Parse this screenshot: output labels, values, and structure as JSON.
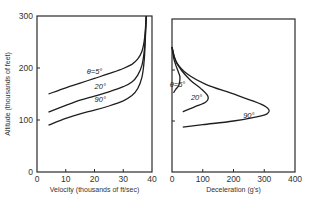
{
  "chart_data": [
    {
      "type": "line",
      "title": "",
      "xlabel": "Velocity (thousands of ft/sec)",
      "ylabel": "Altitude (thousands of feet)",
      "xlim": [
        0,
        40
      ],
      "ylim": [
        0,
        300
      ],
      "xticks": [
        0,
        10,
        20,
        30,
        40
      ],
      "yticks": [
        0,
        100,
        200,
        300
      ],
      "grid": false,
      "series": [
        {
          "name": "θ=5°",
          "label": "θ=5°",
          "x": [
            4,
            10,
            15,
            20,
            25,
            30,
            33,
            35,
            36.5,
            37.3,
            37.7,
            38
          ],
          "y": [
            150,
            162,
            171,
            180,
            189,
            199,
            207,
            217,
            232,
            252,
            275,
            300
          ]
        },
        {
          "name": "20°",
          "label": "20°",
          "x": [
            4,
            10,
            15,
            20,
            25,
            30,
            33,
            35,
            36.5,
            37.3,
            37.7,
            38
          ],
          "y": [
            115,
            128,
            138,
            146,
            154,
            164,
            173,
            186,
            205,
            232,
            265,
            300
          ]
        },
        {
          "name": "90°",
          "label": "90°",
          "x": [
            4,
            10,
            15,
            20,
            25,
            30,
            33,
            35,
            36.5,
            37.3,
            37.7,
            38
          ],
          "y": [
            90,
            103,
            112,
            119,
            127,
            137,
            147,
            160,
            182,
            215,
            258,
            300
          ]
        }
      ]
    },
    {
      "type": "line",
      "title": "",
      "xlabel": "Deceleration (g's)",
      "ylabel": "",
      "xlim": [
        0,
        400
      ],
      "ylim": [
        0,
        300
      ],
      "xticks": [
        0,
        100,
        200,
        300,
        400
      ],
      "yticks": [],
      "grid": false,
      "series": [
        {
          "name": "θ=5°",
          "label": "θ=5°",
          "x": [
            0,
            5,
            12,
            20,
            26,
            22,
            12,
            5
          ],
          "y": [
            245,
            225,
            210,
            197,
            185,
            170,
            162,
            155
          ]
        },
        {
          "name": "20°",
          "label": "20°",
          "x": [
            0,
            10,
            30,
            60,
            95,
            117,
            110,
            75,
            35
          ],
          "y": [
            245,
            220,
            200,
            180,
            163,
            148,
            137,
            128,
            118
          ]
        },
        {
          "name": "90°",
          "label": "90°",
          "x": [
            0,
            15,
            50,
            110,
            190,
            260,
            305,
            315,
            290,
            200,
            100,
            35
          ],
          "y": [
            245,
            215,
            192,
            172,
            155,
            140,
            128,
            118,
            110,
            100,
            93,
            88
          ]
        }
      ]
    }
  ]
}
